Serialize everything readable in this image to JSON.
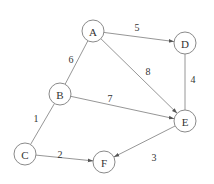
{
  "graph": {
    "nodes": [
      {
        "id": "A",
        "label": "A",
        "x": 93,
        "y": 31
      },
      {
        "id": "B",
        "label": "B",
        "x": 60,
        "y": 94
      },
      {
        "id": "C",
        "label": "C",
        "x": 25,
        "y": 154
      },
      {
        "id": "D",
        "label": "D",
        "x": 185,
        "y": 43
      },
      {
        "id": "E",
        "label": "E",
        "x": 185,
        "y": 121
      },
      {
        "id": "F",
        "label": "F",
        "x": 104,
        "y": 162
      }
    ],
    "edges": [
      {
        "from": "A",
        "to": "D",
        "weight": "5",
        "directed": true,
        "lx": 137,
        "ly": 27
      },
      {
        "from": "A",
        "to": "B",
        "weight": "6",
        "directed": false,
        "lx": 71,
        "ly": 59
      },
      {
        "from": "A",
        "to": "E",
        "weight": "8",
        "directed": true,
        "lx": 148,
        "ly": 71
      },
      {
        "from": "D",
        "to": "E",
        "weight": "4",
        "directed": false,
        "lx": 193,
        "ly": 79
      },
      {
        "from": "B",
        "to": "E",
        "weight": "7",
        "directed": true,
        "lx": 110,
        "ly": 98
      },
      {
        "from": "B",
        "to": "C",
        "weight": "1",
        "directed": false,
        "lx": 36,
        "ly": 118
      },
      {
        "from": "C",
        "to": "F",
        "weight": "2",
        "directed": true,
        "lx": 60,
        "ly": 154
      },
      {
        "from": "E",
        "to": "F",
        "weight": "3",
        "directed": true,
        "lx": 154,
        "ly": 157
      }
    ],
    "node_radius": 11
  }
}
